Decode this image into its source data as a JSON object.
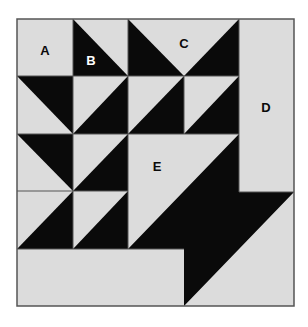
{
  "diagram": {
    "type": "quilt-block",
    "colors": {
      "light": "#dcdcdc",
      "dark": "#0a0a0a",
      "border": "#555555",
      "background": "#ffffff"
    },
    "labels": {
      "a": "A",
      "b": "B",
      "c": "C",
      "d": "D",
      "e": "E"
    },
    "pieces": [
      {
        "id": "A",
        "shape": "square",
        "fill": "light"
      },
      {
        "id": "B",
        "shape": "half-square-triangle",
        "fill": "dark/light"
      },
      {
        "id": "C",
        "shape": "flying-goose triangle",
        "fill": "light"
      },
      {
        "id": "D",
        "shape": "rectangle",
        "fill": "light"
      },
      {
        "id": "E",
        "shape": "large half-square-triangle",
        "fill": "light/dark"
      }
    ]
  }
}
